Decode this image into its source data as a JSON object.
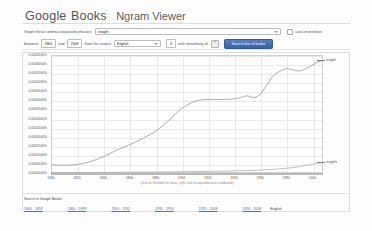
{
  "header": {
    "brand_google": "Google",
    "brand_books": "Books",
    "viewer": "Ngram Viewer"
  },
  "form": {
    "phrase_label": "Graph these comma-separated phrases:",
    "phrase_value": "insight",
    "case_insensitive_label": "case-insensitive",
    "case_insensitive_checked": false,
    "between_label": "between",
    "year_start": "1800",
    "and_label": "and",
    "year_end": "2008",
    "corpus_label": "from the corpus",
    "corpus_value": "English",
    "smoothing_label": "with smoothing of",
    "smoothing_value": "3",
    "help_icon": "question-mark-icon",
    "search_button": "Search lots of books"
  },
  "chart_caption": "(click on line/label for focus, right-click to expand/contract wildcards)",
  "legend": {
    "top_series": "insight",
    "bottom_series": "insights"
  },
  "footer": {
    "title": "Search in Google Books:",
    "ranges": [
      "1800 - 1859",
      "1860 - 1899",
      "1900 - 1931",
      "1932 - 1954",
      "1955 - 2008",
      "1800 - 2008"
    ],
    "english_label": "English",
    "term_label": "insight"
  },
  "colors": {
    "accent_button": "#3f6fbf",
    "line_primary": "#8a8a8a",
    "line_secondary": "#a8a8a8",
    "grid": "#e9e9e9",
    "link": "#4a6fb5"
  },
  "chart_data": {
    "type": "line",
    "title": "",
    "xlabel": "",
    "ylabel": "",
    "xlim": [
      1800,
      2008
    ],
    "ylim": [
      0.0,
      0.00065
    ],
    "grid": true,
    "legend_position": "right-at-line-end",
    "ytick_labels": [
      "0.0006500%",
      "0.0006000%",
      "0.0005500%",
      "0.0005000%",
      "0.0004500%",
      "0.0004000%",
      "0.0003500%",
      "0.0003000%",
      "0.0002500%",
      "0.0002000%",
      "0.0001500%",
      "0.0001000%",
      "0.0000500%",
      "0.0000000%"
    ],
    "ytick_values": [
      0.00065,
      0.0006,
      0.00055,
      0.0005,
      0.00045,
      0.0004,
      0.00035,
      0.0003,
      0.00025,
      0.0002,
      0.00015,
      0.0001,
      5e-05,
      0.0
    ],
    "xtick_labels": [
      "1800",
      "1820",
      "1840",
      "1860",
      "1880",
      "1900",
      "1920",
      "1940",
      "1960",
      "1980",
      "2000"
    ],
    "xtick_values": [
      1800,
      1820,
      1840,
      1860,
      1880,
      1900,
      1920,
      1940,
      1960,
      1980,
      2000
    ],
    "x": [
      1800,
      1810,
      1820,
      1830,
      1840,
      1850,
      1860,
      1870,
      1880,
      1890,
      1900,
      1910,
      1920,
      1930,
      1940,
      1945,
      1950,
      1955,
      1960,
      1965,
      1970,
      1975,
      1980,
      1985,
      1990,
      1995,
      2000,
      2005,
      2008
    ],
    "series": [
      {
        "name": "insight",
        "color": "#8a8a8a",
        "values": [
          4.5e-05,
          4.3e-05,
          4.7e-05,
          6.2e-05,
          9e-05,
          0.000125,
          0.000155,
          0.00019,
          0.00023,
          0.00029,
          0.000355,
          0.000395,
          0.000405,
          0.000405,
          0.000408,
          0.000415,
          0.000425,
          0.000415,
          0.000435,
          0.000485,
          0.000535,
          0.00056,
          0.000575,
          0.000568,
          0.000562,
          0.000575,
          0.000595,
          0.000615,
          0.00062
        ]
      },
      {
        "name": "insights",
        "color": "#a8a8a8",
        "values": [
          3e-06,
          3e-06,
          3e-06,
          3e-06,
          3.5e-06,
          4e-06,
          4.5e-06,
          5e-06,
          5.5e-06,
          6e-06,
          7e-06,
          8e-06,
          9e-06,
          1e-05,
          1.15e-05,
          1.25e-05,
          1.35e-05,
          1.45e-05,
          1.6e-05,
          1.8e-05,
          2e-05,
          2.3e-05,
          2.6e-05,
          3e-05,
          3.5e-05,
          4.2e-05,
          4.9e-05,
          5.5e-05,
          5.8e-05
        ]
      }
    ]
  }
}
